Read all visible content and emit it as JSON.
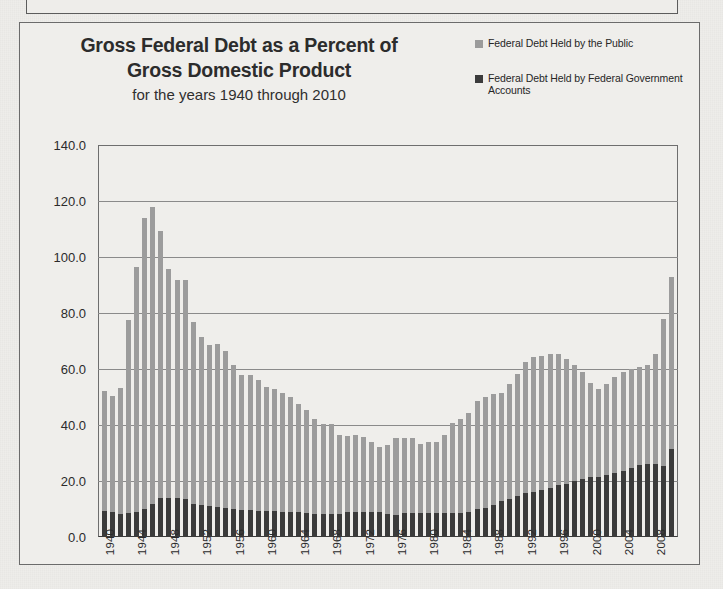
{
  "panel": {
    "title_line1": "Gross Federal Debt as a Percent of",
    "title_line2": "Gross Domestic Product",
    "subtitle": "for the years 1940 through 2010"
  },
  "legend": {
    "items": [
      {
        "label": "Federal Debt Held by the Public",
        "color": "#9c9c9c",
        "swatch_name": "legend-swatch-public"
      },
      {
        "label": "Federal Debt Held by Federal Government Accounts",
        "color": "#3b3b3b",
        "swatch_name": "legend-swatch-government"
      }
    ]
  },
  "chart_data": {
    "type": "bar",
    "title": "Gross Federal Debt as a Percent of Gross Domestic Product",
    "subtitle": "for the years 1940 through 2010",
    "xlabel": "",
    "ylabel": "",
    "ylim": [
      0.0,
      140.0
    ],
    "yticks": [
      "0.0",
      "20.0",
      "40.0",
      "60.0",
      "80.0",
      "100.0",
      "120.0",
      "140.0"
    ],
    "ytick_values": [
      0,
      20,
      40,
      60,
      80,
      100,
      120,
      140
    ],
    "grid": true,
    "stacked": true,
    "legend_position": "top-right",
    "xtick_interval": 4,
    "xtick_labels": [
      "1940",
      "1944",
      "1948",
      "1952",
      "1956",
      "1960",
      "1964",
      "1968",
      "1972",
      "1976",
      "1980",
      "1984",
      "1988",
      "1992",
      "1996",
      "2000",
      "2004",
      "2008"
    ],
    "categories": [
      1940,
      1941,
      1942,
      1943,
      1944,
      1945,
      1946,
      1947,
      1948,
      1949,
      1950,
      1951,
      1952,
      1953,
      1954,
      1955,
      1956,
      1957,
      1958,
      1959,
      1960,
      1961,
      1962,
      1963,
      1964,
      1965,
      1966,
      1967,
      1968,
      1969,
      1970,
      1971,
      1972,
      1973,
      1974,
      1975,
      1976,
      1977,
      1978,
      1979,
      1980,
      1981,
      1982,
      1983,
      1984,
      1985,
      1986,
      1987,
      1988,
      1989,
      1990,
      1991,
      1992,
      1993,
      1994,
      1995,
      1996,
      1997,
      1998,
      1999,
      2000,
      2001,
      2002,
      2003,
      2004,
      2005,
      2006,
      2007,
      2008,
      2009,
      2010
    ],
    "series": [
      {
        "name": "Federal Debt Held by the Public",
        "color": "#9c9c9c",
        "values": [
          43.0,
          41.7,
          45.2,
          69.0,
          87.6,
          103.9,
          106.1,
          95.5,
          82.0,
          78.0,
          78.5,
          65.2,
          60.2,
          57.5,
          58.0,
          55.9,
          51.3,
          48.1,
          48.4,
          46.7,
          44.3,
          43.7,
          42.4,
          41.0,
          38.7,
          36.7,
          33.8,
          31.9,
          32.0,
          28.3,
          27.1,
          27.4,
          26.5,
          25.1,
          23.2,
          24.6,
          27.2,
          27.1,
          26.6,
          24.6,
          25.5,
          25.2,
          28.0,
          32.3,
          33.6,
          35.3,
          38.5,
          39.6,
          39.5,
          38.9,
          40.9,
          43.8,
          46.8,
          48.2,
          47.9,
          47.7,
          46.8,
          44.5,
          41.6,
          38.2,
          33.6,
          31.4,
          32.5,
          34.5,
          35.6,
          35.6,
          35.3,
          35.2,
          39.3,
          52.3,
          61.3
        ]
      },
      {
        "name": "Federal Debt Held by Federal Government Accounts",
        "color": "#3b3b3b",
        "values": [
          9.3,
          8.8,
          8.1,
          8.4,
          9.0,
          10.0,
          11.8,
          13.8,
          13.9,
          13.8,
          13.4,
          11.7,
          11.4,
          11.1,
          10.8,
          10.5,
          10.1,
          9.8,
          9.5,
          9.3,
          9.3,
          9.3,
          9.1,
          9.0,
          8.9,
          8.6,
          8.3,
          8.3,
          8.3,
          8.2,
          9.0,
          9.1,
          9.1,
          8.9,
          8.8,
          8.3,
          8.0,
          8.4,
          8.6,
          8.6,
          8.6,
          8.6,
          8.6,
          8.4,
          8.5,
          9.0,
          9.9,
          10.5,
          11.5,
          12.7,
          13.6,
          14.6,
          15.6,
          16.1,
          16.7,
          17.5,
          18.4,
          19.1,
          20.0,
          20.7,
          21.3,
          21.6,
          22.2,
          22.7,
          23.5,
          24.5,
          25.6,
          26.2,
          26.1,
          25.5,
          31.6
        ]
      }
    ]
  }
}
